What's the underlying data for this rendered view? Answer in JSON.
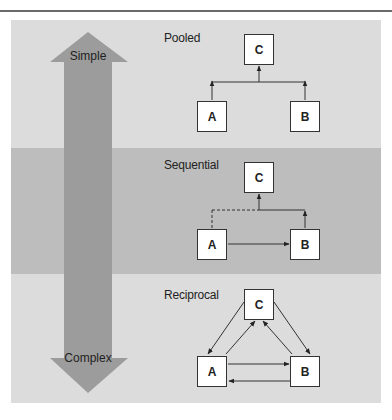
{
  "colors": {
    "panel_light": "#dcdcdc",
    "panel_mid_band": "#bdbdbd",
    "arrow_fill": "#9c9c9c",
    "box_fill": "#ffffff",
    "line": "#333333"
  },
  "complexity_arrow": {
    "top_label": "Simple",
    "bottom_label": "Complex"
  },
  "sections": [
    {
      "title": "Pooled",
      "nodes": [
        "C",
        "A",
        "B"
      ],
      "edges": [
        {
          "from": "A",
          "to": "C",
          "style": "solid"
        },
        {
          "from": "B",
          "to": "C",
          "style": "solid"
        }
      ]
    },
    {
      "title": "Sequential",
      "nodes": [
        "C",
        "A",
        "B"
      ],
      "edges": [
        {
          "from": "A",
          "to": "B",
          "style": "solid"
        },
        {
          "from": "B",
          "to": "C",
          "style": "solid"
        },
        {
          "from": "A",
          "to": "C",
          "style": "dashed"
        }
      ]
    },
    {
      "title": "Reciprocal",
      "nodes": [
        "C",
        "A",
        "B"
      ],
      "edges": [
        {
          "from": "C",
          "to": "A",
          "style": "solid"
        },
        {
          "from": "A",
          "to": "C",
          "style": "solid"
        },
        {
          "from": "C",
          "to": "B",
          "style": "solid"
        },
        {
          "from": "B",
          "to": "C",
          "style": "solid"
        },
        {
          "from": "A",
          "to": "B",
          "style": "solid"
        },
        {
          "from": "B",
          "to": "A",
          "style": "solid"
        }
      ]
    }
  ]
}
